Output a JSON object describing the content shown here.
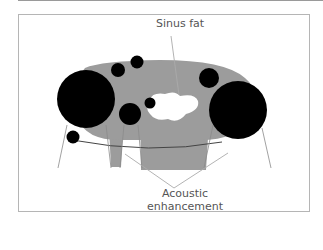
{
  "diagram": {
    "labels": {
      "sinus_fat": "Sinus fat",
      "acoustic_line1": "Acoustic",
      "acoustic_line2": "enhancement"
    },
    "colors": {
      "kidney_gray": "#9c9c9c",
      "cyst_black": "#000000",
      "sinus_white": "#ffffff",
      "line_gray": "#8a8a8a",
      "frame": "#b5b5b5"
    }
  }
}
